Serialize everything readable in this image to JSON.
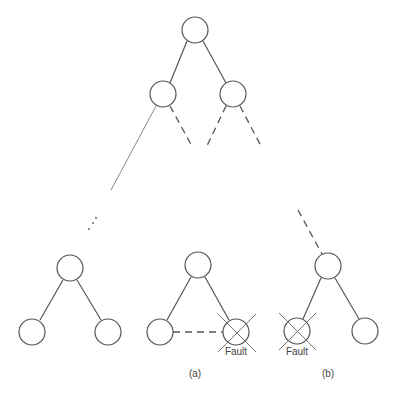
{
  "diagram": {
    "type": "binary-tree-fault-recovery",
    "top_tree": {
      "root": {
        "cx": 195,
        "cy": 30
      },
      "children": [
        {
          "cx": 163,
          "cy": 94
        },
        {
          "cx": 233,
          "cy": 94
        }
      ]
    },
    "subfigures": [
      {
        "id": "plain",
        "caption": ""
      },
      {
        "id": "a",
        "caption": "(a)",
        "fault_label": "Fault"
      },
      {
        "id": "b",
        "caption": "(b)",
        "fault_label": "Fault"
      }
    ],
    "node_radius": 13,
    "colors": {
      "stroke": "#555555",
      "cross": "#777777",
      "text": "#444444",
      "background": "#ffffff"
    }
  }
}
